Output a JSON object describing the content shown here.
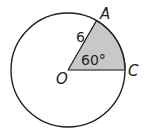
{
  "diagram": {
    "circle": {
      "cx": 68,
      "cy": 70,
      "r": 57,
      "stroke": "#231f20",
      "fill": "#ffffff"
    },
    "sector": {
      "from_deg": 0,
      "to_deg": 60,
      "fill": "#c8c8c8"
    },
    "points": {
      "O": {
        "label": "O"
      },
      "A": {
        "label": "A"
      },
      "C": {
        "label": "C"
      }
    },
    "radius_label": "6",
    "angle_label": "60°"
  }
}
